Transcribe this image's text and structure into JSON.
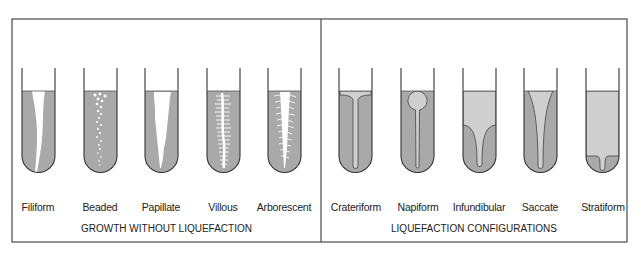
{
  "figure": {
    "colors": {
      "frame": "#4a4a4a",
      "medium": "#a9a9a9",
      "liquefied": "#cfcfcf",
      "growth": "#ffffff",
      "tube_outline": "#333333"
    }
  },
  "panels": [
    {
      "caption": "GROWTH WITHOUT LIQUEFACTION",
      "tubes": [
        {
          "label": "Filiform"
        },
        {
          "label": "Beaded"
        },
        {
          "label": "Papillate"
        },
        {
          "label": "Villous"
        },
        {
          "label": "Arborescent"
        }
      ]
    },
    {
      "caption": "LIQUEFACTION CONFIGURATIONS",
      "tubes": [
        {
          "label": "Crateriform"
        },
        {
          "label": "Napiform"
        },
        {
          "label": "Infundibular"
        },
        {
          "label": "Saccate"
        },
        {
          "label": "Stratiform"
        }
      ]
    }
  ]
}
